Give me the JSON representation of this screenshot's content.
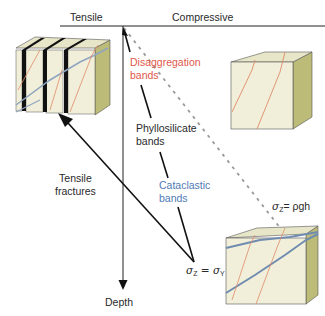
{
  "axis": {
    "tensile_label": "Tensile",
    "compressive_label": "Compressive",
    "depth_label": "Depth"
  },
  "labels": {
    "disaggregation": {
      "line1": "Disaggregation",
      "line2": "bands",
      "color": "#e0574a"
    },
    "phyllosilicate": {
      "line1": "Phyllosilicate",
      "line2": "bands",
      "color": "#2a2a2a"
    },
    "cataclastic": {
      "line1": "Cataclastic",
      "line2": "bands",
      "color": "#4f7bb5"
    },
    "tensile_fractures": {
      "line1": "Tensile",
      "line2": "fractures",
      "color": "#2a2a2a"
    }
  },
  "equations": {
    "sigma_z_rho_g_h": {
      "lhs": "σ",
      "lhs_sub": "Z",
      "rhs": "= ρgh"
    },
    "sigma_z_sigma_y": {
      "lhs": "σ",
      "lhs_sub": "Z",
      "mid": " = σ",
      "rhs_sub": "Y"
    }
  },
  "blocks": [
    {
      "name": "tensile-fracture-block",
      "description": "Block split by black tensile fractures with red and blue bands"
    },
    {
      "name": "disaggregation-block",
      "description": "Block with thin red disaggregation bands"
    },
    {
      "name": "cataclastic-block",
      "description": "Block with blue cataclastic bands and red bands"
    }
  ],
  "colors": {
    "block_face": "#f1efd9",
    "block_top": "#e8e6c8",
    "block_side": "#bdbb78",
    "red_band": "#e08a6a",
    "blue_band": "#7d97b8",
    "fracture": "#111111",
    "dashed": "#9a9a9a"
  }
}
